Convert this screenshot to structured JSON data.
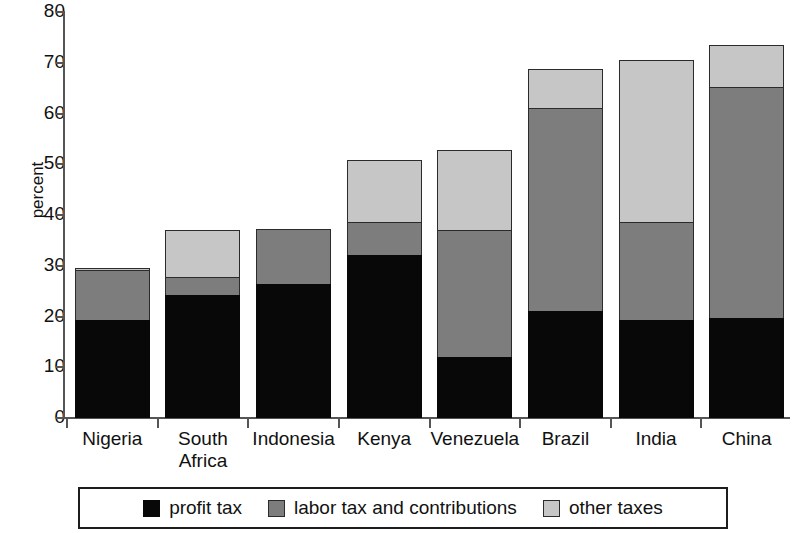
{
  "chart_data": {
    "type": "bar",
    "subtype": "stacked-bar",
    "title": "",
    "xlabel": "",
    "ylabel": "percent",
    "ylim": [
      0,
      80
    ],
    "yticks": [
      0,
      10,
      20,
      30,
      40,
      50,
      60,
      70,
      80
    ],
    "grid": false,
    "legend_position": "bottom",
    "categories": [
      "Nigeria",
      "South\nAfrica",
      "Indonesia",
      "Kenya",
      "Venezuela",
      "Brazil",
      "India",
      "China"
    ],
    "series": [
      {
        "name": "profit tax",
        "color": "#080808",
        "values": [
          19.3,
          24.2,
          26.4,
          32.1,
          12.0,
          21.1,
          19.3,
          19.7
        ]
      },
      {
        "name": "labor tax and contributions",
        "color": "#7d7d7d",
        "values": [
          9.8,
          3.6,
          10.8,
          6.5,
          25.1,
          40.0,
          19.3,
          45.5
        ]
      },
      {
        "name": "other taxes",
        "color": "#c6c6c6",
        "values": [
          0.5,
          9.2,
          0.0,
          12.2,
          15.8,
          7.7,
          31.9,
          8.3
        ]
      }
    ],
    "totals": [
      29.6,
      37.0,
      37.2,
      50.8,
      52.8,
      68.8,
      70.5,
      73.5
    ]
  },
  "axis": {
    "y_title": "percent",
    "y_tick_labels": [
      "0",
      "10",
      "20",
      "30",
      "40",
      "50",
      "60",
      "70",
      "80"
    ]
  },
  "legend": {
    "items": [
      {
        "label": "profit tax",
        "color": "#080808"
      },
      {
        "label": "labor tax and contributions",
        "color": "#7d7d7d"
      },
      {
        "label": "other taxes",
        "color": "#c6c6c6"
      }
    ]
  }
}
